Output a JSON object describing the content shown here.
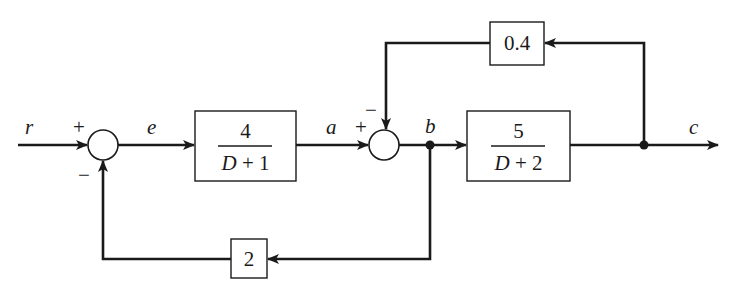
{
  "diagram": {
    "type": "block-diagram",
    "signals": {
      "input": "r",
      "error": "e",
      "after_block1": "a",
      "after_sum2": "b",
      "output": "c"
    },
    "summing_junctions": [
      {
        "id": "sum1",
        "inputs": [
          "r",
          "feedback_2"
        ],
        "signs": {
          "top": "+",
          "bottom": "−"
        },
        "plus_label": "+",
        "minus_label": "−"
      },
      {
        "id": "sum2",
        "inputs": [
          "a",
          "feedback_0_4"
        ],
        "signs": {
          "left": "+",
          "top": "−"
        },
        "plus_label": "+",
        "minus_label": "−"
      }
    ],
    "blocks": {
      "forward1": {
        "numerator": "4",
        "denominator_var": "D",
        "denominator_rest": " + 1"
      },
      "forward2": {
        "numerator": "5",
        "denominator_var": "D",
        "denominator_rest": " + 2"
      },
      "feedback_top": {
        "gain": "0.4"
      },
      "feedback_bottom": {
        "gain": "2"
      }
    },
    "connections": [
      {
        "from": "r",
        "to": "sum1"
      },
      {
        "from": "sum1",
        "to": "forward1",
        "label": "e"
      },
      {
        "from": "forward1",
        "to": "sum2",
        "label": "a"
      },
      {
        "from": "sum2",
        "to": "node_b",
        "label": "b"
      },
      {
        "from": "node_b",
        "to": "forward2"
      },
      {
        "from": "forward2",
        "to": "node_c"
      },
      {
        "from": "node_c",
        "to": "output",
        "label": "c"
      },
      {
        "from": "node_c",
        "to": "feedback_top"
      },
      {
        "from": "feedback_top",
        "to": "sum2",
        "sign": "−"
      },
      {
        "from": "node_b",
        "to": "feedback_bottom"
      },
      {
        "from": "feedback_bottom",
        "to": "sum1",
        "sign": "−"
      }
    ]
  }
}
